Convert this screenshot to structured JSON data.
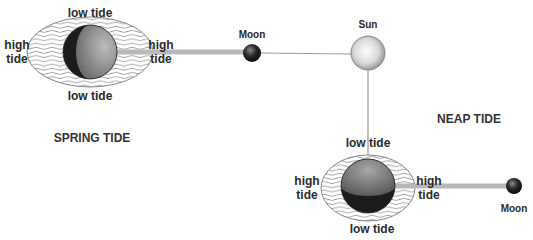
{
  "diagram": {
    "spring": {
      "title": "SPRING TIDE",
      "labels": {
        "top": "low tide",
        "bottom": "low tide",
        "left_line1": "high",
        "left_line2": "tide",
        "right_line1": "high",
        "right_line2": "tide"
      },
      "moon_label": "Moon"
    },
    "sun_label": "Sun",
    "neap": {
      "title": "NEAP TIDE",
      "labels": {
        "top": "low tide",
        "bottom": "low tide",
        "left_line1": "high",
        "left_line2": "tide",
        "right_line1": "high",
        "right_line2": "tide"
      },
      "moon_label": "Moon"
    },
    "colors": {
      "beam": "#b8b8b8",
      "line": "#999999",
      "text": "#2a2a2a"
    }
  }
}
